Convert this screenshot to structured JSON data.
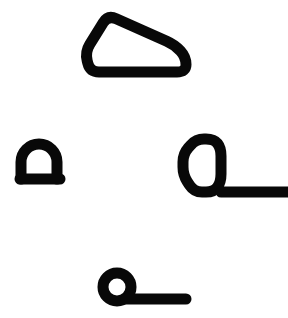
{
  "canvas": {
    "width": 288,
    "height": 318,
    "background_color": "#ffffff",
    "ink_color": "#080808",
    "description": "Four thick black outlined abstract shapes on a plain white field"
  },
  "shapes": [
    {
      "id": "wedge-outline",
      "name": "rounded-wedge-quadrilateral",
      "label": "Rounded wedge outline",
      "position": "top-center",
      "bounds": {
        "x": 78,
        "y": 9,
        "width": 115,
        "height": 70
      },
      "stroke_width": 11,
      "filled": false,
      "vertices": [
        [
          108,
          15
        ],
        [
          175,
          45
        ],
        [
          186,
          57
        ],
        [
          186,
          72
        ],
        [
          90,
          72
        ],
        [
          85,
          52
        ]
      ],
      "corner_radius": 9
    },
    {
      "id": "dome-outline",
      "name": "dome-arch-on-base",
      "label": "Small dome arch on flat base",
      "position": "mid-left",
      "bounds": {
        "x": 14,
        "y": 141,
        "width": 52,
        "height": 44
      },
      "stroke_width": 11,
      "filled": false,
      "arch": {
        "cx": 39,
        "cy": 162,
        "rx": 18,
        "ry": 18
      },
      "base": {
        "x1": 20,
        "x2": 60,
        "y": 179
      }
    },
    {
      "id": "loop-with-tail",
      "name": "rounded-polygon-loop-with-tail",
      "label": "Rounded polygon loop with horizontal tail to right edge",
      "position": "mid-right",
      "bounds": {
        "x": 178,
        "y": 133,
        "width": 110,
        "height": 67
      },
      "stroke_width": 11,
      "filled": false,
      "vertices": [
        [
          196,
          139
        ],
        [
          214,
          139
        ],
        [
          221,
          148
        ],
        [
          221,
          182
        ],
        [
          214,
          192
        ],
        [
          194,
          192
        ],
        [
          183,
          175
        ],
        [
          183,
          154
        ]
      ],
      "corner_radius": 8,
      "tail": {
        "x1": 221,
        "x2": 288,
        "y": 192
      }
    },
    {
      "id": "ring-with-tail",
      "name": "ring-with-tail",
      "label": "Circular ring with horizontal tail to the right",
      "position": "bottom-center",
      "bounds": {
        "x": 98,
        "y": 268,
        "width": 89,
        "height": 40
      },
      "stroke_width": 11,
      "filled": false,
      "ring": {
        "cx": 117,
        "cy": 287,
        "r": 14
      },
      "tail": {
        "x1": 126,
        "x2": 186,
        "y": 299
      }
    }
  ]
}
